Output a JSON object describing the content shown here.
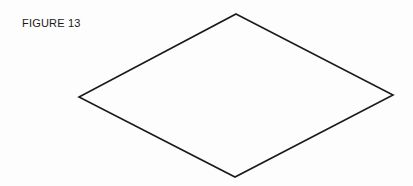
{
  "figure": {
    "caption": "FIGURE 13",
    "shape": "rhombus",
    "vertices": {
      "top": [
        236,
        14
      ],
      "right": [
        393,
        95
      ],
      "bottom": [
        235,
        177
      ],
      "left": [
        79,
        97
      ]
    },
    "stroke_color": "#1a1a1a",
    "background": "#fdfdfd"
  }
}
